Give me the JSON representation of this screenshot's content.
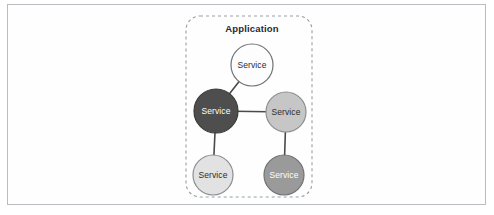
{
  "figure": {
    "width": 494,
    "height": 215,
    "background_color": "#ffffff",
    "frame_color": "#b9bcc0"
  },
  "diagram": {
    "type": "node-graph",
    "group": {
      "label": "Application",
      "label_x": 252,
      "label_y": 28,
      "boundary": {
        "style": "dashed",
        "x": 186,
        "y": 16,
        "width": 126,
        "height": 181,
        "radius": 14,
        "stroke_color": "#9a9da1",
        "dash": "3 3"
      }
    },
    "edge_color": "#4a4a4a",
    "edge_width": 1.6,
    "nodes": [
      {
        "id": "service-top",
        "label": "Service",
        "cx": 252,
        "cy": 65,
        "r": 21,
        "fill": "#fdfdfd",
        "stroke": "#6f7276",
        "text_color": "#2b2b2b"
      },
      {
        "id": "service-center-left",
        "label": "Service",
        "cx": 216,
        "cy": 111,
        "r": 22,
        "fill": "#4e4e4e",
        "stroke": "#3a3a3a",
        "text_color": "#ffffff"
      },
      {
        "id": "service-center-right",
        "label": "Service",
        "cx": 286,
        "cy": 112,
        "r": 20,
        "fill": "#c6c6c6",
        "stroke": "#8b8e91",
        "text_color": "#2b2b2b"
      },
      {
        "id": "service-bottom-left",
        "label": "Service",
        "cx": 213,
        "cy": 175,
        "r": 20,
        "fill": "#e2e2e2",
        "stroke": "#8b8e91",
        "text_color": "#2b2b2b"
      },
      {
        "id": "service-bottom-right",
        "label": "Service",
        "cx": 284,
        "cy": 175,
        "r": 20,
        "fill": "#9a9a9a",
        "stroke": "#6f7276",
        "text_color": "#ffffff"
      }
    ],
    "edges": [
      {
        "from": "service-top",
        "to": "service-center-left"
      },
      {
        "from": "service-center-left",
        "to": "service-center-right"
      },
      {
        "from": "service-center-left",
        "to": "service-bottom-left"
      },
      {
        "from": "service-center-right",
        "to": "service-bottom-right"
      }
    ]
  }
}
